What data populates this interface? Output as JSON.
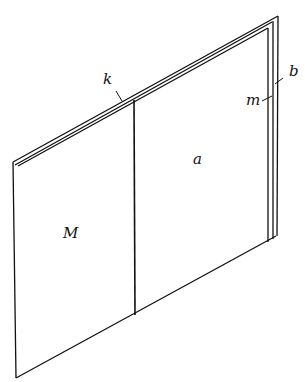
{
  "diagram": {
    "type": "line-drawing",
    "labels": {
      "k": "k",
      "a": "a",
      "M": "M",
      "m": "m",
      "b": "b"
    },
    "stroke_color": "#111111",
    "background": "#ffffff"
  }
}
